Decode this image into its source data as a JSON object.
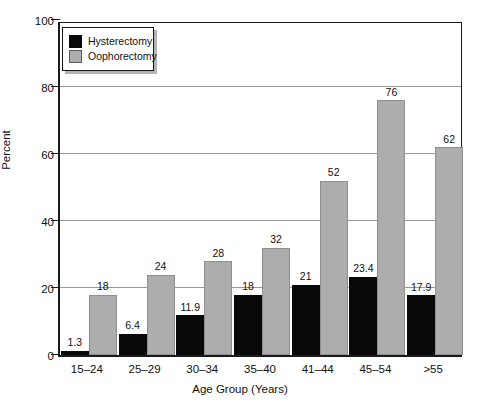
{
  "chart_data": {
    "type": "bar",
    "title": "",
    "xlabel": "Age Group (Years)",
    "ylabel": "Percent",
    "categories": [
      "15–24",
      "25–29",
      "30–34",
      "35–40",
      "41–44",
      "45–54",
      ">55"
    ],
    "series": [
      {
        "name": "Hysterectomy",
        "color": "#090909",
        "values": [
          1.3,
          6.4,
          11.9,
          18,
          21,
          23.4,
          17.9
        ],
        "labels": [
          "1.3",
          "6.4",
          "11.9",
          "18",
          "21",
          "23.4",
          "17.9"
        ]
      },
      {
        "name": "Oophorectomy",
        "color": "#adadad",
        "values": [
          18,
          24,
          28,
          32,
          52,
          76,
          62
        ],
        "labels": [
          "18",
          "24",
          "28",
          "32",
          "52",
          "76",
          "62"
        ]
      }
    ],
    "ylim": [
      0,
      100
    ],
    "yticks": [
      0,
      20,
      40,
      60,
      80,
      100
    ],
    "ytick_labels": [
      "0",
      "20",
      "40",
      "60",
      "80",
      "100"
    ],
    "grid": true,
    "legend_position": "upper-left"
  },
  "legend": {
    "entries": [
      {
        "label": "Hysterectomy",
        "swatch": "black-square-swatch"
      },
      {
        "label": "Oophorectomy",
        "swatch": "gray-square-swatch"
      }
    ]
  }
}
